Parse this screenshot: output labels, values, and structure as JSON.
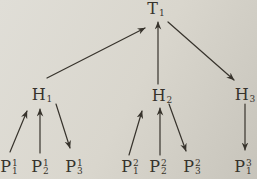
{
  "figure": {
    "type": "tree-diagram",
    "background_color": "#d9d6cd",
    "ink_color": "#37332c",
    "levels": 3
  },
  "nodes": [
    {
      "id": "T1",
      "base": "T",
      "sub": "1"
    },
    {
      "id": "H1",
      "base": "H",
      "sub": "1"
    },
    {
      "id": "H2",
      "base": "H",
      "sub": "2"
    },
    {
      "id": "H3",
      "base": "H",
      "sub": "3"
    },
    {
      "id": "P11",
      "base": "P",
      "sup": "1",
      "sub": "1"
    },
    {
      "id": "P12",
      "base": "P",
      "sup": "1",
      "sub": "2"
    },
    {
      "id": "P13",
      "base": "P",
      "sup": "1",
      "sub": "3"
    },
    {
      "id": "P21",
      "base": "P",
      "sup": "2",
      "sub": "1"
    },
    {
      "id": "P22",
      "base": "P",
      "sup": "2",
      "sub": "2"
    },
    {
      "id": "P23",
      "base": "P",
      "sup": "2",
      "sub": "3"
    },
    {
      "id": "P31",
      "base": "P",
      "sup": "3",
      "sub": "1"
    }
  ],
  "edges": [
    {
      "from": "H1",
      "to": "T1"
    },
    {
      "from": "H2",
      "to": "T1"
    },
    {
      "from": "T1",
      "to": "H3"
    },
    {
      "from": "P11",
      "to": "H1"
    },
    {
      "from": "P12",
      "to": "H1"
    },
    {
      "from": "H1",
      "to": "P13"
    },
    {
      "from": "P21",
      "to": "H2"
    },
    {
      "from": "P22",
      "to": "H2"
    },
    {
      "from": "H2",
      "to": "P23"
    },
    {
      "from": "H3",
      "to": "P31"
    }
  ]
}
